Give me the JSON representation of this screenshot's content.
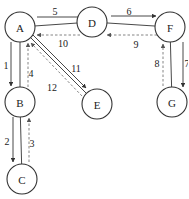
{
  "diagram": {
    "type": "traversal-graph",
    "nodes": [
      {
        "id": "A",
        "label": "A",
        "x": 20,
        "y": 27
      },
      {
        "id": "D",
        "label": "D",
        "x": 92,
        "y": 22
      },
      {
        "id": "F",
        "label": "F",
        "x": 170,
        "y": 27
      },
      {
        "id": "B",
        "label": "B",
        "x": 20,
        "y": 102
      },
      {
        "id": "E",
        "label": "E",
        "x": 97,
        "y": 104
      },
      {
        "id": "G",
        "label": "G",
        "x": 172,
        "y": 102
      },
      {
        "id": "C",
        "label": "C",
        "x": 22,
        "y": 179
      }
    ],
    "undirected_edges": [
      {
        "from": "A",
        "to": "D"
      },
      {
        "from": "D",
        "to": "F"
      },
      {
        "from": "A",
        "to": "B"
      },
      {
        "from": "B",
        "to": "C"
      },
      {
        "from": "F",
        "to": "G"
      },
      {
        "from": "A",
        "to": "E"
      }
    ],
    "steps": [
      {
        "label": "1",
        "from": "A",
        "to": "B",
        "style": "solid"
      },
      {
        "label": "2",
        "from": "B",
        "to": "C",
        "style": "solid"
      },
      {
        "label": "3",
        "from": "C",
        "to": "B",
        "style": "dashed"
      },
      {
        "label": "4",
        "from": "B",
        "to": "A",
        "style": "dashed"
      },
      {
        "label": "5",
        "from": "A",
        "to": "D",
        "style": "solid"
      },
      {
        "label": "6",
        "from": "D",
        "to": "F",
        "style": "solid"
      },
      {
        "label": "7",
        "from": "F",
        "to": "G",
        "style": "solid"
      },
      {
        "label": "8",
        "from": "G",
        "to": "F",
        "style": "dashed"
      },
      {
        "label": "9",
        "from": "F",
        "to": "D",
        "style": "dashed"
      },
      {
        "label": "10",
        "from": "D",
        "to": "A",
        "style": "dashed"
      },
      {
        "label": "11",
        "from": "A",
        "to": "E",
        "style": "solid"
      },
      {
        "label": "12",
        "from": "E",
        "to": "A",
        "style": "dashed"
      }
    ],
    "colors": {
      "stroke": "#333333",
      "dashed": "#777777",
      "background": "#ffffff"
    }
  }
}
